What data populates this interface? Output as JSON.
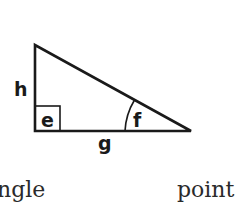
{
  "diagram": {
    "type": "right-triangle",
    "stroke_color": "#1a1a1a",
    "vertices": {
      "top": [
        35,
        45
      ],
      "right_angle_corner": [
        35,
        131
      ],
      "acute_corner": [
        191,
        131
      ]
    },
    "labels": {
      "vertical_side": "h",
      "right_angle": "e",
      "acute_angle": "f",
      "base_side": "g"
    }
  },
  "captions": {
    "left": "ngle",
    "right": "point"
  }
}
